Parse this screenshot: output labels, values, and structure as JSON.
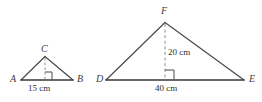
{
  "figure": {
    "stroke_color": "#4a4a4a",
    "base_stroke_color": "#3a3a3a",
    "dash_color": "#8a8a8a",
    "text_color": "#3c3c3c",
    "background": "#ffffff"
  },
  "triangles": [
    {
      "id": "small-triangle",
      "vertices": {
        "left": "A",
        "right": "B",
        "apex": "C"
      },
      "base_label": "15 cm",
      "height_label": "",
      "has_right_angle_marker": true,
      "has_dashed_altitude": true
    },
    {
      "id": "large-triangle",
      "vertices": {
        "left": "D",
        "right": "E",
        "apex": "F"
      },
      "base_label": "40 cm",
      "height_label": "20 cm",
      "has_right_angle_marker": true,
      "has_dashed_altitude": true
    }
  ]
}
